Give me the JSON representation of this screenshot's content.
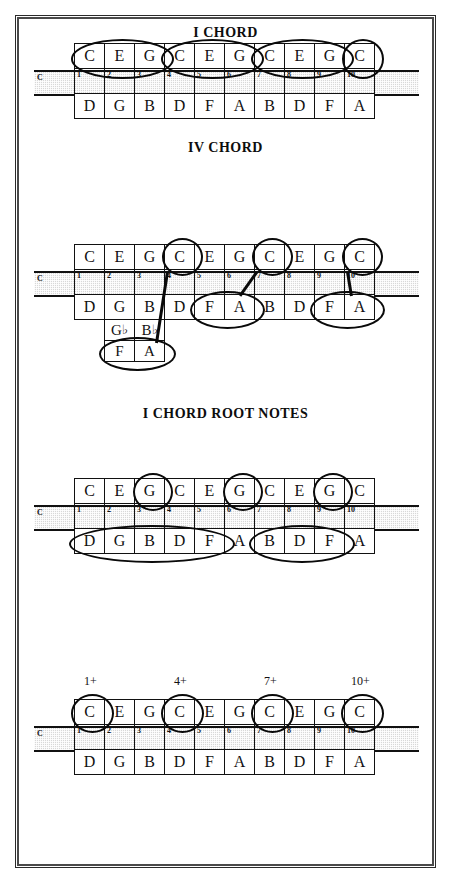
{
  "page": {
    "key_label": "C",
    "blow_row": [
      "C",
      "E",
      "G",
      "C",
      "E",
      "G",
      "C",
      "E",
      "G",
      "C"
    ],
    "draw_row": [
      "D",
      "G",
      "B",
      "D",
      "F",
      "A",
      "B",
      "D",
      "F",
      "A"
    ],
    "holes": [
      "1",
      "2",
      "3",
      "4",
      "5",
      "6",
      "7",
      "8",
      "9",
      "10"
    ]
  },
  "sections": [
    {
      "title": "I CHORD",
      "top_labels": [],
      "bottom_labels": [],
      "bends": []
    },
    {
      "title": "IV CHORD",
      "top_labels": [],
      "bottom_labels": [],
      "bends": [
        {
          "hole": 2,
          "tier1": "G♭",
          "tier2": "F"
        },
        {
          "hole": 3,
          "tier1": "B♭",
          "tier2": "A"
        }
      ]
    },
    {
      "title": "V CHORD",
      "top_labels": [],
      "bottom_labels": [],
      "bends": []
    },
    {
      "title": "I CHORD ROOT NOTES",
      "top_labels": [
        {
          "hole": 1,
          "text": "1+"
        },
        {
          "hole": 4,
          "text": "4+"
        },
        {
          "hole": 7,
          "text": "7+"
        },
        {
          "hole": 10,
          "text": "10+"
        }
      ],
      "bottom_labels": [],
      "bends": []
    },
    {
      "title": "IV CHORD ROOT NOTES",
      "top_labels": [],
      "bottom_labels": [
        {
          "hole": 5,
          "text": "5"
        },
        {
          "hole": 9,
          "text": "9"
        }
      ],
      "bends": [
        {
          "hole": 2,
          "tier1": "G♭",
          "tier2": "F",
          "label": "2\""
        }
      ]
    },
    {
      "title": "V CHORD ROOT NOTES",
      "top_labels": [
        {
          "hole": 6,
          "text": "6+"
        },
        {
          "hole": 9,
          "text": "9+"
        }
      ],
      "bottom_labels": [
        {
          "hole": 2,
          "text": "2"
        }
      ],
      "bends": []
    }
  ],
  "chart_data": {
    "type": "table",
    "instrument": "10-hole diatonic harmonica",
    "key": "C",
    "holes": [
      1,
      2,
      3,
      4,
      5,
      6,
      7,
      8,
      9,
      10
    ],
    "blow_notes": [
      "C",
      "E",
      "G",
      "C",
      "E",
      "G",
      "C",
      "E",
      "G",
      "C"
    ],
    "draw_notes": [
      "D",
      "G",
      "B",
      "D",
      "F",
      "A",
      "B",
      "D",
      "F",
      "A"
    ],
    "bend_notes_tier1": {
      "2": "G♭",
      "3": "B♭"
    },
    "bend_notes_tier2": {
      "2": "F",
      "3": "A"
    },
    "panels": [
      {
        "title": "I CHORD",
        "chord": "C major",
        "blow_groups": [
          [
            1,
            2,
            3
          ],
          [
            4,
            5,
            6
          ],
          [
            7,
            8,
            9
          ],
          [
            10
          ]
        ],
        "draw_groups": []
      },
      {
        "title": "IV CHORD",
        "chord": "F major",
        "blow_singles": [
          4,
          7,
          10
        ],
        "draw_groups": [
          [
            5,
            6
          ],
          [
            9,
            10
          ]
        ],
        "bend_group": [
          2,
          3
        ],
        "connectors": [
          "4-blow to 3-bend",
          "7-blow to 5/6-draw",
          "10-blow to 9/10-draw"
        ]
      },
      {
        "title": "V CHORD",
        "chord": "G major",
        "blow_singles": [
          3,
          6,
          9
        ],
        "draw_groups": [
          [
            1,
            2,
            3,
            4,
            5
          ],
          [
            7,
            8,
            9
          ]
        ]
      },
      {
        "title": "I CHORD ROOT NOTES",
        "chord": "C root",
        "blow_singles": [
          1,
          4,
          7,
          10
        ],
        "labels": [
          "1+",
          "4+",
          "7+",
          "10+"
        ]
      },
      {
        "title": "IV CHORD ROOT NOTES",
        "chord": "F root",
        "draw_singles": [
          5,
          9
        ],
        "bend_singles": [
          2
        ],
        "labels": [
          "5",
          "9",
          "2\""
        ]
      },
      {
        "title": "V CHORD ROOT NOTES",
        "chord": "G root",
        "blow_singles": [
          6,
          9
        ],
        "draw_singles": [
          2
        ],
        "labels": [
          "6+",
          "9+",
          "2"
        ]
      }
    ]
  }
}
